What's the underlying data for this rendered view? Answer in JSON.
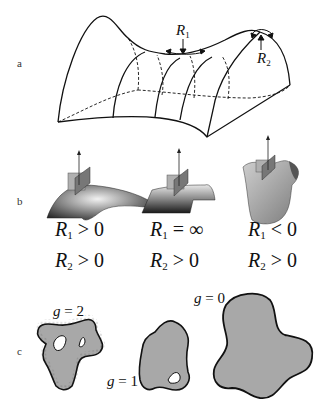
{
  "figure": {
    "panels": [
      {
        "label": "a",
        "description": "Saddle surface with principal radii of curvature",
        "annotations": [
          {
            "symbol": "R",
            "subscript": "1"
          },
          {
            "symbol": "R",
            "subscript": "2"
          }
        ]
      },
      {
        "label": "b",
        "description": "Surfaces with different curvature signs",
        "cases": [
          {
            "r1": {
              "symbol": "R",
              "subscript": "1",
              "relation": " > 0"
            },
            "r2": {
              "symbol": "R",
              "subscript": "2",
              "relation": " > 0"
            }
          },
          {
            "r1": {
              "symbol": "R",
              "subscript": "1",
              "relation": " = ∞"
            },
            "r2": {
              "symbol": "R",
              "subscript": "2",
              "relation": " > 0"
            }
          },
          {
            "r1": {
              "symbol": "R",
              "subscript": "1",
              "relation": " < 0"
            },
            "r2": {
              "symbol": "R",
              "subscript": "2",
              "relation": " > 0"
            }
          }
        ]
      },
      {
        "label": "c",
        "description": "Closed surfaces with different genus",
        "shapes": [
          {
            "symbol": "g",
            "value": " = 2"
          },
          {
            "symbol": "g",
            "value": " = 1"
          },
          {
            "symbol": "g",
            "value": " = 0"
          }
        ]
      }
    ],
    "colors": {
      "line": "#111111",
      "fill_gray": "#a8a8a8",
      "plane_gray": "#9a9a9a"
    }
  }
}
